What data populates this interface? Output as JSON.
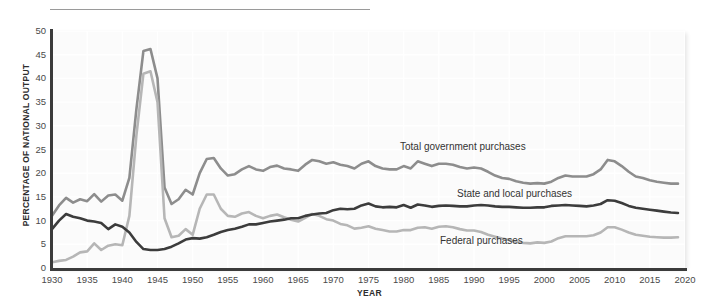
{
  "chart_data": {
    "type": "line",
    "title": "",
    "xlabel": "YEAR",
    "ylabel": "PERCENTAGE OF NATIONAL OUTPUT",
    "xlim": [
      1930,
      2020
    ],
    "ylim": [
      0,
      50
    ],
    "grid": true,
    "legend_position": "inline-annotations",
    "x_ticks": [
      "1930",
      "1935",
      "1940",
      "1945",
      "1950",
      "1955",
      "1960",
      "1965",
      "1970",
      "1975",
      "1980",
      "1985",
      "1990",
      "1995",
      "2000",
      "2005",
      "2010",
      "2015",
      "2020"
    ],
    "y_ticks": [
      "0",
      "5",
      "10",
      "15",
      "20",
      "25",
      "30",
      "35",
      "40",
      "45",
      "50"
    ],
    "x": [
      1930,
      1931,
      1932,
      1933,
      1934,
      1935,
      1936,
      1937,
      1938,
      1939,
      1940,
      1941,
      1942,
      1943,
      1944,
      1945,
      1946,
      1947,
      1948,
      1949,
      1950,
      1951,
      1952,
      1953,
      1954,
      1955,
      1956,
      1957,
      1958,
      1959,
      1960,
      1961,
      1962,
      1963,
      1964,
      1965,
      1966,
      1967,
      1968,
      1969,
      1970,
      1971,
      1972,
      1973,
      1974,
      1975,
      1976,
      1977,
      1978,
      1979,
      1980,
      1981,
      1982,
      1983,
      1984,
      1985,
      1986,
      1987,
      1988,
      1989,
      1990,
      1991,
      1992,
      1993,
      1994,
      1995,
      1996,
      1997,
      1998,
      1999,
      2000,
      2001,
      2002,
      2003,
      2004,
      2005,
      2006,
      2007,
      2008,
      2009,
      2010,
      2011,
      2012,
      2013,
      2014,
      2015,
      2016,
      2017,
      2018,
      2019
    ],
    "series": [
      {
        "name": "Total government purchases",
        "color": "#8d8d8d",
        "values": [
          11.0,
          13.2,
          14.8,
          13.8,
          14.5,
          14.1,
          15.6,
          14.0,
          15.3,
          15.5,
          14.2,
          19.0,
          33.5,
          45.8,
          46.2,
          40.0,
          17.0,
          13.5,
          14.5,
          16.5,
          15.5,
          20.0,
          23.0,
          23.2,
          21.0,
          19.5,
          19.8,
          20.8,
          21.5,
          20.8,
          20.5,
          21.3,
          21.6,
          21.0,
          20.8,
          20.5,
          21.8,
          22.8,
          22.5,
          22.0,
          22.3,
          21.8,
          21.5,
          21.0,
          22.0,
          22.5,
          21.5,
          21.0,
          20.8,
          20.8,
          21.5,
          21.0,
          22.5,
          22.0,
          21.5,
          22.0,
          22.0,
          21.8,
          21.3,
          21.0,
          21.2,
          21.0,
          20.3,
          19.5,
          19.0,
          18.8,
          18.3,
          18.0,
          17.8,
          17.9,
          17.8,
          18.2,
          19.0,
          19.5,
          19.3,
          19.3,
          19.3,
          19.8,
          20.8,
          22.8,
          22.5,
          21.5,
          20.3,
          19.3,
          19.0,
          18.5,
          18.2,
          18.0,
          17.8,
          17.8
        ]
      },
      {
        "name": "Federal purchases",
        "color": "#b6b6b6",
        "values": [
          1.2,
          1.5,
          1.7,
          2.4,
          3.3,
          3.5,
          5.2,
          3.8,
          4.7,
          5.0,
          4.8,
          11.0,
          28.0,
          41.0,
          41.5,
          35.0,
          10.5,
          6.5,
          6.8,
          8.2,
          7.0,
          12.5,
          15.5,
          15.5,
          12.5,
          11.0,
          10.8,
          11.5,
          11.8,
          11.0,
          10.5,
          11.0,
          11.3,
          10.7,
          10.2,
          9.8,
          10.6,
          11.4,
          11.0,
          10.3,
          10.0,
          9.3,
          9.0,
          8.3,
          8.5,
          8.8,
          8.3,
          8.0,
          7.7,
          7.7,
          8.0,
          8.0,
          8.5,
          8.6,
          8.3,
          8.7,
          8.8,
          8.6,
          8.2,
          7.9,
          7.9,
          7.6,
          7.0,
          6.6,
          6.2,
          5.9,
          5.5,
          5.3,
          5.2,
          5.4,
          5.3,
          5.6,
          6.3,
          6.7,
          6.7,
          6.7,
          6.7,
          6.9,
          7.5,
          8.6,
          8.6,
          8.1,
          7.5,
          7.0,
          6.8,
          6.6,
          6.5,
          6.4,
          6.4,
          6.5
        ]
      },
      {
        "name": "State and local purchases",
        "color": "#3c3c3c",
        "values": [
          8.2,
          10.0,
          11.4,
          10.8,
          10.5,
          10.0,
          9.8,
          9.5,
          8.2,
          9.2,
          8.7,
          7.5,
          5.5,
          4.0,
          3.8,
          3.8,
          4.0,
          4.5,
          5.2,
          6.0,
          6.3,
          6.2,
          6.5,
          7.0,
          7.6,
          8.0,
          8.3,
          8.7,
          9.2,
          9.2,
          9.5,
          9.8,
          10.0,
          10.2,
          10.5,
          10.5,
          11.0,
          11.3,
          11.5,
          11.6,
          12.2,
          12.5,
          12.4,
          12.5,
          13.2,
          13.6,
          13.0,
          12.8,
          12.9,
          12.8,
          13.3,
          12.7,
          13.4,
          13.2,
          12.9,
          13.1,
          13.2,
          13.1,
          13.0,
          13.0,
          13.2,
          13.3,
          13.2,
          13.0,
          12.9,
          12.9,
          12.8,
          12.7,
          12.7,
          12.8,
          12.8,
          13.1,
          13.2,
          13.3,
          13.2,
          13.1,
          13.0,
          13.2,
          13.5,
          14.3,
          14.2,
          13.7,
          13.1,
          12.7,
          12.5,
          12.3,
          12.1,
          11.9,
          11.7,
          11.6
        ]
      }
    ],
    "annotations": [
      {
        "text": "Total government purchases",
        "x_px": 400,
        "y_px": 141
      },
      {
        "text": "State and local purchases",
        "x_px": 457,
        "y_px": 188
      },
      {
        "text": "Federal purchases",
        "x_px": 440,
        "y_px": 235
      }
    ]
  }
}
